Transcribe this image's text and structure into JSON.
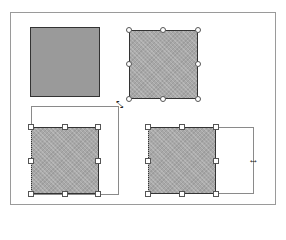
{
  "canvas": {
    "background": "#ffffff",
    "frame_border": "#9a9a9a"
  },
  "shapes": [
    {
      "id": "square-1",
      "state": "unselected",
      "fill": "solid-gray"
    },
    {
      "id": "square-2",
      "state": "selected",
      "handles": "round"
    },
    {
      "id": "square-3",
      "state": "resizing-diagonal",
      "handles": "square"
    },
    {
      "id": "square-4",
      "state": "resizing-horizontal",
      "handles": "square"
    }
  ],
  "cursors": {
    "diagonal_resize": "⤡",
    "horizontal_resize": "↔"
  },
  "colors": {
    "fill": "#9a9a9a",
    "outline": "#333333",
    "handle": "#ffffff"
  }
}
